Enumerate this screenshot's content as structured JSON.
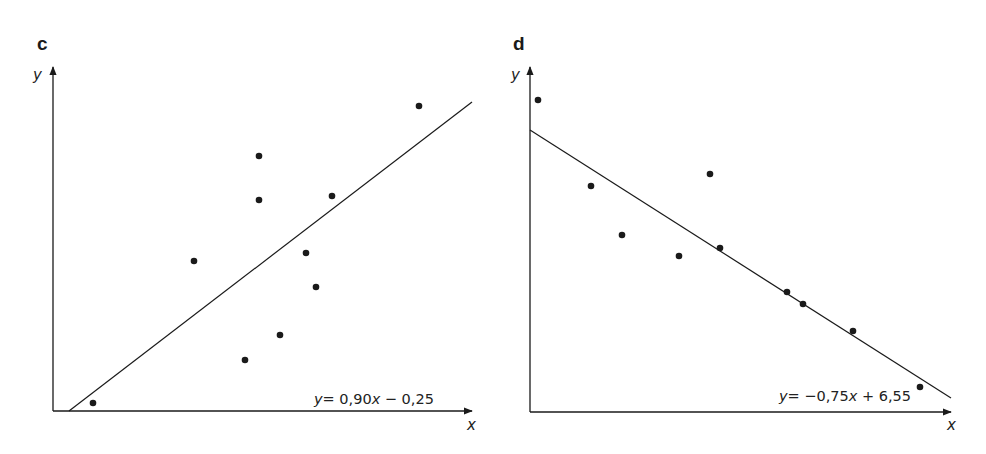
{
  "chart_data": [
    {
      "type": "scatter",
      "panel_label": "c",
      "title": "",
      "xlabel": "x",
      "ylabel": "y",
      "grid": false,
      "trendline": {
        "equation_text": "y = 0,90x − 0,25",
        "slope": 0.9,
        "intercept": -0.25
      },
      "points_px": [
        [
          93,
          403
        ],
        [
          194,
          261
        ],
        [
          245,
          360
        ],
        [
          259,
          156
        ],
        [
          259,
          200
        ],
        [
          280,
          335
        ],
        [
          306,
          253
        ],
        [
          316,
          287
        ],
        [
          332,
          196
        ],
        [
          419,
          106
        ]
      ],
      "line_px": [
        [
          69,
          411
        ],
        [
          472,
          102
        ]
      ],
      "axes_px": {
        "origin": [
          53,
          411
        ],
        "x_end": [
          472,
          411
        ],
        "y_end": [
          53,
          67
        ]
      }
    },
    {
      "type": "scatter",
      "panel_label": "d",
      "title": "",
      "xlabel": "x",
      "ylabel": "y",
      "grid": false,
      "trendline": {
        "equation_text": "y = −0,75x + 6,55",
        "slope": -0.75,
        "intercept": 6.55
      },
      "points_px": [
        [
          538,
          100
        ],
        [
          591,
          186
        ],
        [
          622,
          235
        ],
        [
          679,
          256
        ],
        [
          710,
          174
        ],
        [
          720,
          248
        ],
        [
          787,
          292
        ],
        [
          803,
          304
        ],
        [
          853,
          331
        ],
        [
          920,
          387
        ]
      ],
      "line_px": [
        [
          530,
          130
        ],
        [
          951,
          398
        ]
      ],
      "axes_px": {
        "origin": [
          530,
          412
        ],
        "x_end": [
          951,
          412
        ],
        "y_end": [
          530,
          67
        ]
      }
    }
  ],
  "panels": [
    {
      "label": "c",
      "y_axis_label": "y",
      "x_axis_label": "x",
      "equation": {
        "y": "y",
        "eq": "= 0,90",
        "x": "x",
        "rest": " − 0,25"
      }
    },
    {
      "label": "d",
      "y_axis_label": "y",
      "x_axis_label": "x",
      "equation": {
        "y": "y",
        "eq": "= −0,75",
        "x": "x",
        "rest": " + 6,55"
      }
    }
  ],
  "colors": {
    "ink": "#1a1a1a",
    "background": "#ffffff"
  }
}
